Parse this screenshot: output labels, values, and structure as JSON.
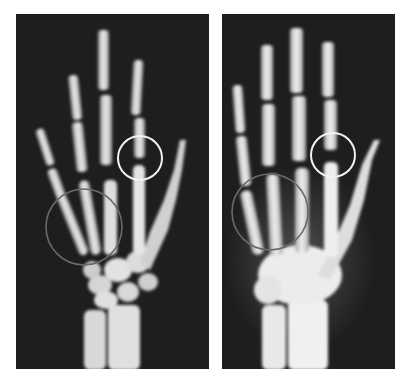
{
  "figure": {
    "background": "#ffffff",
    "film_color": "#1e1e1e",
    "bone_color": "#e6e6e6",
    "panels": [
      {
        "id": "left",
        "label": "younger-hand-xray",
        "bounds": {
          "x": 16,
          "y": 14,
          "w": 193,
          "h": 355
        },
        "annotations": [
          {
            "type": "circle",
            "color": "#f2f2f2",
            "cx": 140,
            "cy": 158,
            "r": 22,
            "region": "metacarpophalangeal-joint"
          },
          {
            "type": "circle",
            "color": "#6a6a6a",
            "cx": 84,
            "cy": 227,
            "r": 38,
            "region": "metacarpals"
          }
        ]
      },
      {
        "id": "right",
        "label": "older-hand-xray",
        "bounds": {
          "x": 222,
          "y": 14,
          "w": 173,
          "h": 355
        },
        "annotations": [
          {
            "type": "circle",
            "color": "#f2f2f2",
            "cx": 333,
            "cy": 155,
            "r": 22,
            "region": "metacarpophalangeal-joint"
          },
          {
            "type": "circle",
            "color": "#6a6a6a",
            "cx": 270,
            "cy": 212,
            "r": 38,
            "region": "metacarpals"
          }
        ]
      }
    ]
  }
}
